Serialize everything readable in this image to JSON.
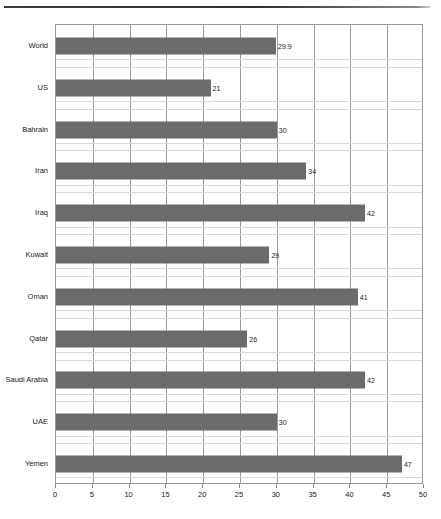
{
  "chart_data": {
    "type": "bar",
    "orientation": "horizontal",
    "title": "",
    "subtitle": "",
    "xlabel": "",
    "ylabel": "",
    "categories": [
      "World",
      "US",
      "Bahrain",
      "Iran",
      "Iraq",
      "Kuwait",
      "Oman",
      "Qatar",
      "Saudi Arabia",
      "UAE",
      "Yemen"
    ],
    "values": [
      29.9,
      21,
      30,
      34,
      42,
      29,
      41,
      26,
      42,
      30,
      47
    ],
    "value_labels": [
      "29.9",
      "21",
      "30",
      "34",
      "42",
      "29",
      "41",
      "26",
      "42",
      "30",
      "47"
    ],
    "xlim": [
      0,
      50
    ],
    "xticks": [
      0,
      5,
      10,
      15,
      20,
      25,
      30,
      35,
      40,
      45,
      50
    ],
    "xtick_labels": [
      "0",
      "5",
      "10",
      "15",
      "20",
      "25",
      "30",
      "35",
      "40",
      "45",
      "50"
    ],
    "grid": "vertical-major-and-horizontal-minor",
    "legend": null,
    "bar_color": "#6b6b6b",
    "gridline_color": "#9a9a9a",
    "minor_gridline_color": "#d8d8d8",
    "axis_color": "#9a9a9a"
  },
  "caption": {
    "text": ""
  }
}
